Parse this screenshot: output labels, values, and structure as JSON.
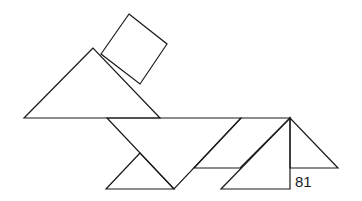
{
  "figure": {
    "type": "tangram",
    "label": "81",
    "stroke_color": "#1a1a1a",
    "background": "#ffffff",
    "pieces": [
      {
        "name": "square",
        "points": "129,14 167,44 140,84 101,54"
      },
      {
        "name": "large-triangle-head",
        "points": "93,48 24,118 160,118"
      },
      {
        "name": "large-triangle-body",
        "points": "107,118 241,118 174,189"
      },
      {
        "name": "small-triangle-front-leg",
        "points": "140,153 106,189 174,189"
      },
      {
        "name": "parallelogram",
        "points": "241,118 290,118 240,168 194,168"
      },
      {
        "name": "medium-triangle",
        "points": "290,118 290,189 221,189"
      },
      {
        "name": "small-triangle-tail",
        "points": "290,118 290,168 338,168"
      }
    ]
  }
}
